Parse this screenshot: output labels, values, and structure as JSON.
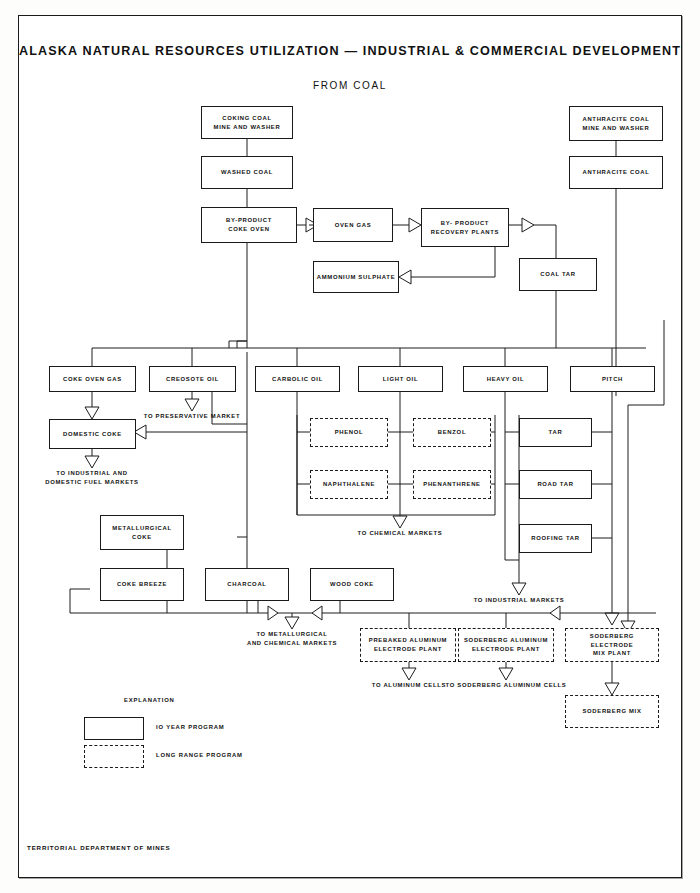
{
  "sheet": {
    "title": "ALASKA NATURAL RESOURCES UTILIZATION — INDUSTRIAL & COMMERCIAL DEVELOPMENT",
    "subtitle": "FROM COAL",
    "footer": "TERRITORIAL DEPARTMENT OF MINES",
    "ink": "#1a1a1a",
    "paper": "#ffffff"
  },
  "legend": {
    "heading": "EXPLANATION",
    "items": [
      {
        "style": "solid",
        "label": "IO YEAR PROGRAM"
      },
      {
        "style": "dashed",
        "label": "LONG RANGE PROGRAM"
      }
    ]
  },
  "nodes": [
    {
      "id": "coking_coal",
      "line1": "COKING COAL",
      "line2": "MINE AND WASHER",
      "style": "solid"
    },
    {
      "id": "washed_coal",
      "line1": "WASHED COAL",
      "line2": "",
      "style": "solid"
    },
    {
      "id": "byproduct_oven",
      "line1": "BY-PRODUCT",
      "line2": "COKE OVEN",
      "style": "solid"
    },
    {
      "id": "oven_gas",
      "line1": "OVEN GAS",
      "line2": "",
      "style": "solid"
    },
    {
      "id": "recovery_plants",
      "line1": "BY- PRODUCT",
      "line2": "RECOVERY PLANTS",
      "style": "solid"
    },
    {
      "id": "ammonium",
      "line1": "AMMONIUM SULPHATE",
      "line2": "",
      "style": "solid"
    },
    {
      "id": "anthracite_mine",
      "line1": "ANTHRACITE COAL",
      "line2": "MINE AND WASHER",
      "style": "solid"
    },
    {
      "id": "anthracite_coal",
      "line1": "ANTHRACITE COAL",
      "line2": "",
      "style": "solid"
    },
    {
      "id": "coal_tar",
      "line1": "COAL TAR",
      "line2": "",
      "style": "solid"
    },
    {
      "id": "coke_oven_gas",
      "line1": "COKE OVEN GAS",
      "line2": "",
      "style": "solid"
    },
    {
      "id": "creosote_oil",
      "line1": "CREOSOTE OIL",
      "line2": "",
      "style": "solid"
    },
    {
      "id": "carbolic_oil",
      "line1": "CARBOLIC OIL",
      "line2": "",
      "style": "solid"
    },
    {
      "id": "light_oil",
      "line1": "LIGHT OIL",
      "line2": "",
      "style": "solid"
    },
    {
      "id": "heavy_oil",
      "line1": "HEAVY OIL",
      "line2": "",
      "style": "solid"
    },
    {
      "id": "pitch",
      "line1": "PITCH",
      "line2": "",
      "style": "solid"
    },
    {
      "id": "domestic_coke",
      "line1": "DOMESTIC COKE",
      "line2": "",
      "style": "solid"
    },
    {
      "id": "phenol",
      "line1": "PHENOL",
      "line2": "",
      "style": "dashed"
    },
    {
      "id": "benzol",
      "line1": "BENZOL",
      "line2": "",
      "style": "dashed"
    },
    {
      "id": "naphthalene",
      "line1": "NAPHTHALENE",
      "line2": "",
      "style": "dashed"
    },
    {
      "id": "phenanthrene",
      "line1": "PHENANTHRENE",
      "line2": "",
      "style": "dashed"
    },
    {
      "id": "tar",
      "line1": "TAR",
      "line2": "",
      "style": "solid"
    },
    {
      "id": "road_tar",
      "line1": "ROAD TAR",
      "line2": "",
      "style": "solid"
    },
    {
      "id": "roofing_tar",
      "line1": "ROOFING TAR",
      "line2": "",
      "style": "solid"
    },
    {
      "id": "metallurgical",
      "line1": "METALLURGICAL",
      "line2": "COKE",
      "style": "solid"
    },
    {
      "id": "coke_breeze",
      "line1": "COKE BREEZE",
      "line2": "",
      "style": "solid"
    },
    {
      "id": "charcoal",
      "line1": "CHARCOAL",
      "line2": "",
      "style": "solid"
    },
    {
      "id": "wood_coke",
      "line1": "WOOD COKE",
      "line2": "",
      "style": "solid"
    },
    {
      "id": "prebaked",
      "line1": "PREBAKED ALUMINUM",
      "line2": "ELECTRODE PLANT",
      "style": "dashed"
    },
    {
      "id": "soderberg_plant",
      "line1": "SODERBERG ALUMINUM",
      "line2": "ELECTRODE PLANT",
      "style": "dashed"
    },
    {
      "id": "soderberg_mixpl",
      "line1": "SODERBERG ELECTRODE",
      "line2": "MIX PLANT",
      "style": "dashed"
    },
    {
      "id": "soderberg_mix",
      "line1": "SODERBERG MIX",
      "line2": "",
      "style": "dashed"
    }
  ],
  "flow_labels": [
    {
      "id": "preservative",
      "line1": "TO PRESERVATIVE MARKET",
      "line2": ""
    },
    {
      "id": "industrial_fuel",
      "line1": "TO INDUSTRIAL AND",
      "line2": "DOMESTIC FUEL MARKETS"
    },
    {
      "id": "chemical",
      "line1": "TO CHEMICAL MARKETS",
      "line2": ""
    },
    {
      "id": "industrial_mkt",
      "line1": "TO INDUSTRIAL MARKETS",
      "line2": ""
    },
    {
      "id": "metall_chem",
      "line1": "TO METALLURGICAL",
      "line2": "AND CHEMICAL MARKETS"
    },
    {
      "id": "alum_cells",
      "line1": "TO ALUMINUM CELLS",
      "line2": ""
    },
    {
      "id": "soder_cells",
      "line1": "TO SODERBERG ALUMINUM CELLS",
      "line2": ""
    }
  ]
}
